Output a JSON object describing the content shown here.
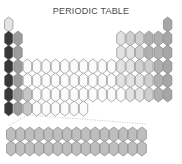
{
  "title": "PERIODIC TABLE",
  "colors": {
    "hydrogen": "#e4e4e4",
    "alkali": "#383838",
    "alkaline_earth": "#9c9c9c",
    "group3": "#c6c6c6",
    "transition": "#fbfbfb",
    "p_light": "#e2e2e2",
    "p_mid": "#cfcfcf",
    "p_dark": "#b0b0b0",
    "noble": "#a6a6a6",
    "f_block": "#bebebe",
    "stroke": "#7a7a7a"
  },
  "layout": {
    "x0": 4.5,
    "pitch_x": 9.35,
    "y0": 17,
    "pitch_y": 14,
    "hex_w": 8.4,
    "hex_h": 15,
    "f_x0": 6.5,
    "f_y0": 127,
    "f_count": 15
  },
  "rows": [
    {
      "period": 1,
      "cells": [
        [
          1,
          "hydrogen"
        ],
        [
          18,
          "noble"
        ]
      ]
    },
    {
      "period": 2,
      "cells": [
        [
          1,
          "alkali"
        ],
        [
          2,
          "alkaline_earth"
        ],
        [
          13,
          "p_light"
        ],
        [
          14,
          "p_mid"
        ],
        [
          15,
          "p_mid"
        ],
        [
          16,
          "p_dark"
        ],
        [
          17,
          "p_dark"
        ],
        [
          18,
          "noble"
        ]
      ]
    },
    {
      "period": 3,
      "cells": [
        [
          1,
          "alkali"
        ],
        [
          2,
          "alkaline_earth"
        ],
        [
          13,
          "p_light"
        ],
        [
          14,
          "p_light"
        ],
        [
          15,
          "p_mid"
        ],
        [
          16,
          "p_dark"
        ],
        [
          17,
          "p_dark"
        ],
        [
          18,
          "noble"
        ]
      ]
    },
    {
      "period": 4,
      "cells": [
        [
          1,
          "alkali"
        ],
        [
          2,
          "alkaline_earth"
        ],
        [
          3,
          "transition"
        ],
        [
          4,
          "transition"
        ],
        [
          5,
          "transition"
        ],
        [
          6,
          "transition"
        ],
        [
          7,
          "transition"
        ],
        [
          8,
          "transition"
        ],
        [
          9,
          "transition"
        ],
        [
          10,
          "transition"
        ],
        [
          11,
          "transition"
        ],
        [
          12,
          "transition"
        ],
        [
          13,
          "p_light"
        ],
        [
          14,
          "p_light"
        ],
        [
          15,
          "p_mid"
        ],
        [
          16,
          "p_mid"
        ],
        [
          17,
          "p_dark"
        ],
        [
          18,
          "noble"
        ]
      ]
    },
    {
      "period": 5,
      "cells": [
        [
          1,
          "alkali"
        ],
        [
          2,
          "alkaline_earth"
        ],
        [
          3,
          "transition"
        ],
        [
          4,
          "transition"
        ],
        [
          5,
          "transition"
        ],
        [
          6,
          "transition"
        ],
        [
          7,
          "transition"
        ],
        [
          8,
          "transition"
        ],
        [
          9,
          "transition"
        ],
        [
          10,
          "transition"
        ],
        [
          11,
          "transition"
        ],
        [
          12,
          "transition"
        ],
        [
          13,
          "p_light"
        ],
        [
          14,
          "p_light"
        ],
        [
          15,
          "p_light"
        ],
        [
          16,
          "p_mid"
        ],
        [
          17,
          "p_dark"
        ],
        [
          18,
          "noble"
        ]
      ]
    },
    {
      "period": 6,
      "cells": [
        [
          1,
          "alkali"
        ],
        [
          2,
          "alkaline_earth"
        ],
        [
          3,
          "group3"
        ],
        [
          4,
          "transition"
        ],
        [
          5,
          "transition"
        ],
        [
          6,
          "transition"
        ],
        [
          7,
          "transition"
        ],
        [
          8,
          "transition"
        ],
        [
          9,
          "transition"
        ],
        [
          10,
          "transition"
        ],
        [
          11,
          "transition"
        ],
        [
          12,
          "transition"
        ],
        [
          13,
          "transition"
        ],
        [
          14,
          "p_light"
        ],
        [
          15,
          "p_light"
        ],
        [
          16,
          "p_mid"
        ],
        [
          17,
          "p_dark"
        ],
        [
          18,
          "noble"
        ]
      ]
    },
    {
      "period": 7,
      "cells": [
        [
          1,
          "alkali"
        ],
        [
          2,
          "alkaline_earth"
        ],
        [
          3,
          "group3"
        ],
        [
          4,
          "transition"
        ],
        [
          5,
          "transition"
        ],
        [
          6,
          "transition"
        ],
        [
          7,
          "transition"
        ],
        [
          8,
          "transition"
        ],
        [
          9,
          "transition"
        ]
      ]
    }
  ],
  "f_rows": [
    "lanthanides",
    "actinides"
  ]
}
